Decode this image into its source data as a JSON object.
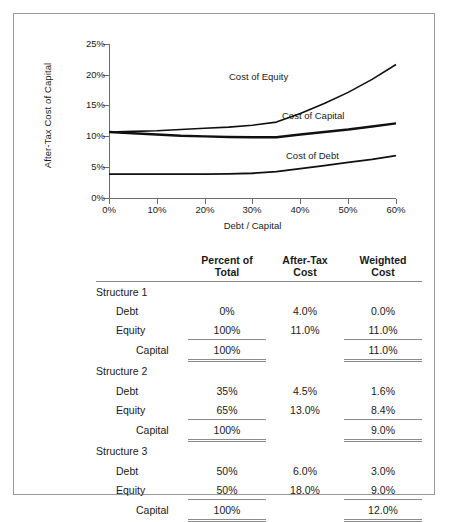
{
  "chart_data": {
    "type": "line",
    "title": "",
    "xlabel": "Debt / Capital",
    "ylabel": "After-Tax Cost of Capital",
    "xlim": [
      0,
      60
    ],
    "ylim": [
      0,
      25
    ],
    "xticks": [
      "0%",
      "10%",
      "20%",
      "30%",
      "40%",
      "50%",
      "60%"
    ],
    "xtick_values": [
      0,
      10,
      20,
      30,
      40,
      50,
      60
    ],
    "yticks": [
      "0%",
      "5%",
      "10%",
      "15%",
      "20%",
      "25%"
    ],
    "ytick_values": [
      0,
      5,
      10,
      15,
      20,
      25
    ],
    "grid": false,
    "legend_position": "inline-annotations",
    "x": [
      0,
      5,
      10,
      15,
      20,
      25,
      30,
      35,
      40,
      45,
      50,
      55,
      60
    ],
    "series": [
      {
        "name": "Cost of Equity",
        "label": "Cost of Equity",
        "values": [
          10.8,
          10.9,
          11.0,
          11.2,
          11.4,
          11.6,
          11.9,
          12.4,
          13.8,
          15.4,
          17.2,
          19.3,
          21.7
        ]
      },
      {
        "name": "Cost of Capital",
        "label": "Cost of Capital",
        "values": [
          10.8,
          10.6,
          10.4,
          10.2,
          10.1,
          10.0,
          9.95,
          9.95,
          10.4,
          10.8,
          11.2,
          11.7,
          12.2
        ]
      },
      {
        "name": "Cost of Debt",
        "label": "Cost of Debt",
        "values": [
          4.0,
          4.0,
          4.0,
          4.0,
          4.0,
          4.05,
          4.15,
          4.4,
          4.9,
          5.4,
          5.9,
          6.4,
          7.0
        ]
      }
    ]
  },
  "table": {
    "columns": [
      "",
      "Percent of Total",
      "After-Tax Cost",
      "Weighted Cost"
    ],
    "headers": [
      {
        "line1": "",
        "line2": ""
      },
      {
        "line1": "Percent of",
        "line2": "Total"
      },
      {
        "line1": "After-Tax",
        "line2": "Cost"
      },
      {
        "line1": "Weighted",
        "line2": "Cost"
      }
    ],
    "groups": [
      {
        "title": "Structure 1",
        "rows": [
          {
            "label": "Debt",
            "percent_of_total": "0%",
            "after_tax_cost": "4.0%",
            "weighted_cost": "0.0%"
          },
          {
            "label": "Equity",
            "percent_of_total": "100%",
            "after_tax_cost": "11.0%",
            "weighted_cost": "11.0%"
          }
        ],
        "total": {
          "label": "Capital",
          "percent_of_total": "100%",
          "after_tax_cost": "",
          "weighted_cost": "11.0%"
        }
      },
      {
        "title": "Structure 2",
        "rows": [
          {
            "label": "Debt",
            "percent_of_total": "35%",
            "after_tax_cost": "4.5%",
            "weighted_cost": "1.6%"
          },
          {
            "label": "Equity",
            "percent_of_total": "65%",
            "after_tax_cost": "13.0%",
            "weighted_cost": "8.4%"
          }
        ],
        "total": {
          "label": "Capital",
          "percent_of_total": "100%",
          "after_tax_cost": "",
          "weighted_cost": "9.0%"
        }
      },
      {
        "title": "Structure 3",
        "rows": [
          {
            "label": "Debt",
            "percent_of_total": "50%",
            "after_tax_cost": "6.0%",
            "weighted_cost": "3.0%"
          },
          {
            "label": "Equity",
            "percent_of_total": "50%",
            "after_tax_cost": "18.0%",
            "weighted_cost": "9.0%"
          }
        ],
        "total": {
          "label": "Capital",
          "percent_of_total": "100%",
          "after_tax_cost": "",
          "weighted_cost": "12.0%"
        }
      }
    ]
  },
  "colors": {
    "line": "#101010",
    "axis": "#6d6d6d",
    "rule": "#8a8a8a",
    "frame": "#9a9a9a",
    "text": "#1a1a1a"
  }
}
